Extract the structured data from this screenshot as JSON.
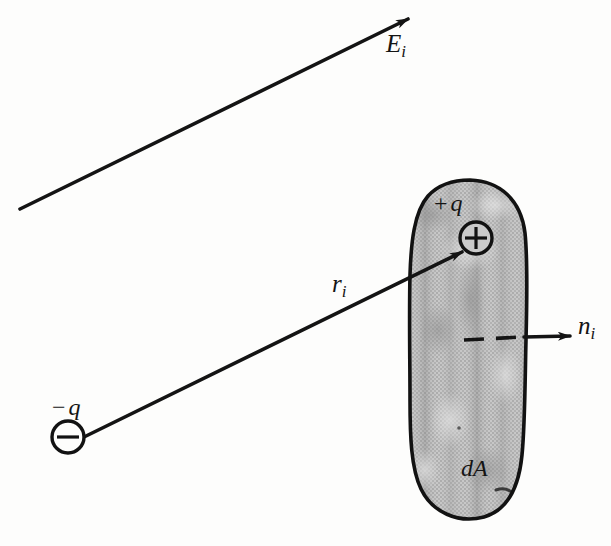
{
  "figure": {
    "background_color": "#fdfdfc",
    "ink_color": "#141414",
    "blob_fill_color": "#b9b9b9"
  },
  "labels": {
    "field_vector": {
      "symbol": "E",
      "subscript": "i",
      "name": "E_i"
    },
    "radius_vector": {
      "symbol": "r",
      "subscript": "i",
      "name": "r_i"
    },
    "normal_vector": {
      "symbol": "n",
      "subscript": "i",
      "name": "n_i"
    },
    "positive_charge": {
      "sign": "+",
      "symbol": "q",
      "name": "+ q"
    },
    "negative_charge": {
      "sign": "−",
      "symbol": "q",
      "name": "− q"
    },
    "area_element": {
      "symbol": "dA",
      "name": "dA"
    }
  },
  "elements": {
    "field_arrow": {
      "from": [
        20,
        209
      ],
      "to": [
        412,
        17
      ]
    },
    "radius_arrow": {
      "from": [
        84,
        437
      ],
      "to": [
        466,
        250
      ]
    },
    "normal_arrow": {
      "from": [
        527,
        336
      ],
      "to": [
        572,
        336
      ]
    },
    "normal_dashes": {
      "from": [
        465,
        340
      ],
      "to": [
        524,
        337
      ]
    },
    "positive_charge_marker": {
      "center": [
        476,
        238
      ],
      "radius": 16,
      "glyph": "+"
    },
    "negative_charge_marker": {
      "center": [
        68,
        437
      ],
      "radius": 16,
      "glyph": "−"
    },
    "surface_blob": {
      "top": 180,
      "bottom": 520,
      "left": 408,
      "right": 528
    }
  }
}
